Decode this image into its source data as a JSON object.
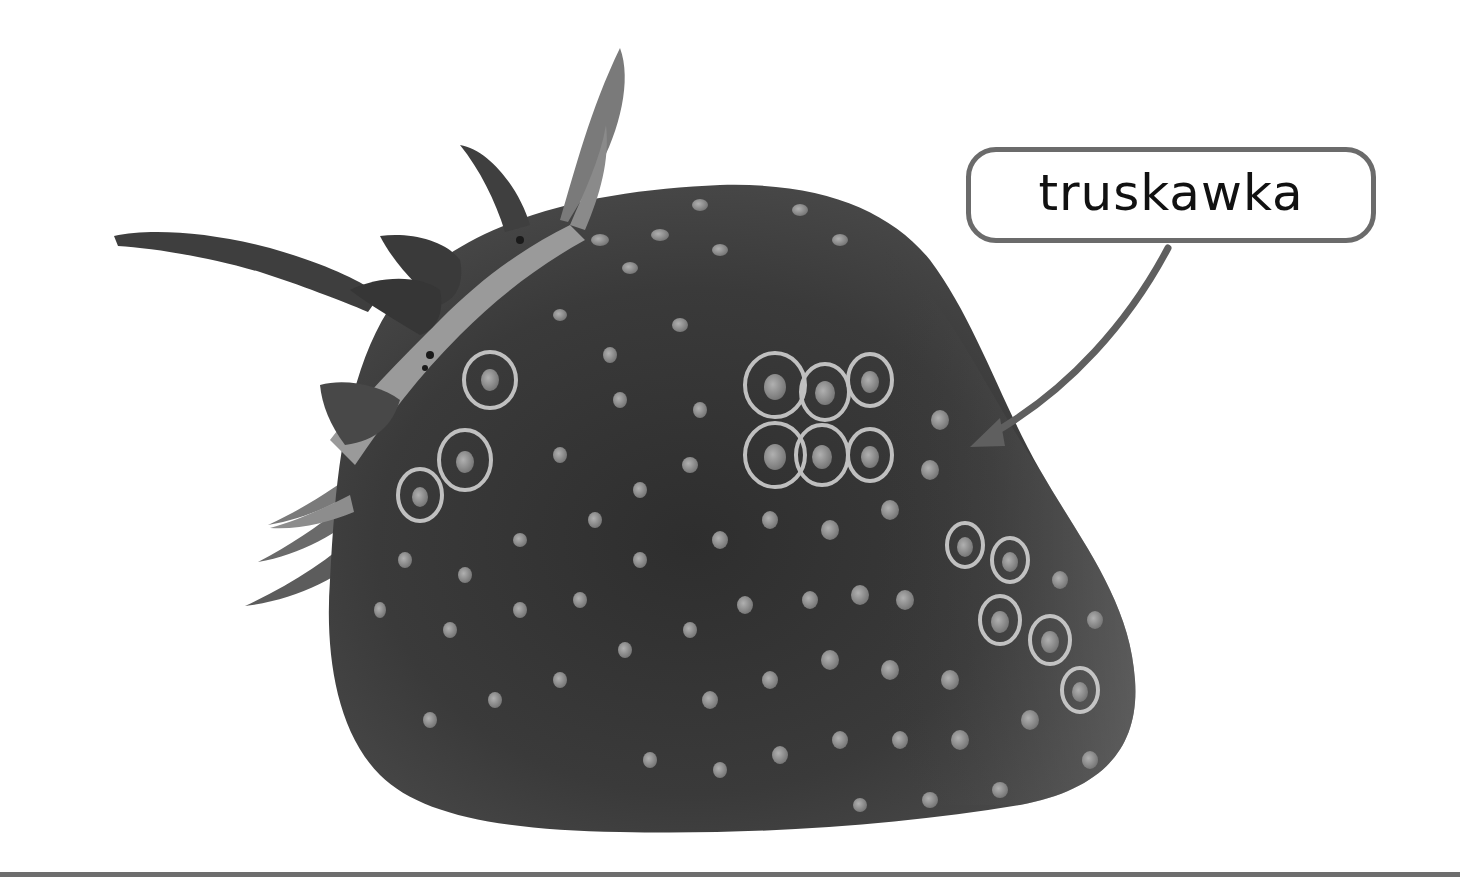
{
  "label": {
    "text": "truskawka",
    "border_color": "#6b6b6b",
    "text_color": "#111111"
  },
  "illustration": {
    "subject": "strawberry",
    "style": "grayscale photo",
    "body_color": "#3a3a3a",
    "seed_color": "#8c8c8c",
    "leaf_color": "#5a5a5a"
  },
  "arrow": {
    "color": "#5f5f5f",
    "from": "label-bubble",
    "to": "strawberry-right-side"
  },
  "divider": {
    "color": "#6e6e6e"
  }
}
